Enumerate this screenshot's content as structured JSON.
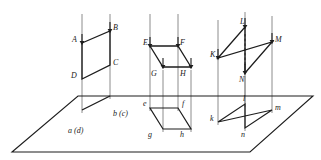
{
  "figure": {
    "type": "descriptive-geometry-diagram",
    "stroke_color": "#1d1d1d",
    "projector_color": "#8c8c8c",
    "background_color": "#ffffff",
    "ground_plane": {
      "name": "horizontal projection plane",
      "points": "12,152 78,96 313,96 250,152"
    },
    "cases": [
      {
        "id": "case-perpendicular",
        "note": "figure perpendicular to plane, projects to a straight line",
        "shape": {
          "name": "parallelogram-ABCD",
          "points": "82,43 110,31 110,65 82,79"
        },
        "projection": {
          "name": "projection-segment-ad-bc",
          "points": "82,110 110,96"
        },
        "projectors": [
          {
            "x1": 82,
            "y1": 14,
            "x2": 82,
            "y2": 113
          },
          {
            "x1": 110,
            "y1": 14,
            "x2": 110,
            "y2": 99
          }
        ],
        "arrows": [
          {
            "x": 82,
            "y": 43,
            "dir": "down"
          },
          {
            "x": 110,
            "y": 31,
            "dir": "down"
          }
        ],
        "labels": [
          {
            "id": "A",
            "text": "A",
            "x": 72,
            "y": 36
          },
          {
            "id": "B",
            "text": "B",
            "x": 113,
            "y": 24
          },
          {
            "id": "C",
            "text": "C",
            "x": 113,
            "y": 59
          },
          {
            "id": "D",
            "text": "D",
            "x": 71,
            "y": 72
          },
          {
            "id": "ad",
            "text": "a (d)",
            "x": 68,
            "y": 127
          },
          {
            "id": "bc",
            "text": "b (c)",
            "x": 113,
            "y": 110
          }
        ]
      },
      {
        "id": "case-parallel",
        "note": "figure parallel to plane, projects to a congruent figure",
        "shape": {
          "name": "parallelogram-EFGH",
          "points": "150,46 178,46 163,67 191,67"
        },
        "shape_order": "E,F,H,G",
        "projection": {
          "name": "projection-parallelogram-efgh",
          "points": "150,108 178,108 163,129 191,129"
        },
        "projectors": [
          {
            "x1": 150,
            "y1": 14,
            "x2": 150,
            "y2": 111
          },
          {
            "x1": 178,
            "y1": 14,
            "x2": 178,
            "y2": 111
          },
          {
            "x1": 163,
            "y1": 70,
            "x2": 163,
            "y2": 132
          },
          {
            "x1": 191,
            "y1": 70,
            "x2": 191,
            "y2": 132
          }
        ],
        "arrows": [
          {
            "x": 150,
            "y": 46,
            "dir": "down"
          },
          {
            "x": 178,
            "y": 46,
            "dir": "down"
          },
          {
            "x": 163,
            "y": 67,
            "dir": "down"
          },
          {
            "x": 191,
            "y": 67,
            "dir": "down"
          }
        ],
        "labels": [
          {
            "id": "E",
            "text": "E",
            "x": 143,
            "y": 39
          },
          {
            "id": "F",
            "text": "F",
            "x": 180,
            "y": 39
          },
          {
            "id": "G",
            "text": "G",
            "x": 151,
            "y": 70
          },
          {
            "id": "H",
            "text": "H",
            "x": 180,
            "y": 70
          },
          {
            "id": "e",
            "text": "e",
            "x": 143,
            "y": 100
          },
          {
            "id": "f",
            "text": "f",
            "x": 182,
            "y": 100
          },
          {
            "id": "g",
            "text": "g",
            "x": 148,
            "y": 131
          },
          {
            "id": "h",
            "text": "h",
            "x": 180,
            "y": 131
          }
        ]
      },
      {
        "id": "case-inclined",
        "note": "figure inclined to plane, projects foreshortened",
        "shape": {
          "name": "parallelogram-KLMN",
          "points": "218,58 245,27 272,42 245,73"
        },
        "shape_order": "K,L,M,N",
        "projection": {
          "name": "projection-parallelogram-klmn",
          "points": "218,122 245,104 272,110 245,128"
        },
        "projectors": [
          {
            "x1": 218,
            "y1": 20,
            "x2": 218,
            "y2": 125
          },
          {
            "x1": 245,
            "y1": 12,
            "x2": 245,
            "y2": 107
          },
          {
            "x1": 272,
            "y1": 16,
            "x2": 272,
            "y2": 113
          },
          {
            "x1": 245,
            "y1": 76,
            "x2": 245,
            "y2": 131
          }
        ],
        "hidden_edge": {
          "x1": 245,
          "y1": 34,
          "x2": 245,
          "y2": 66
        },
        "arrows": [
          {
            "x": 218,
            "y": 58,
            "dir": "down"
          },
          {
            "x": 245,
            "y": 27,
            "dir": "down"
          },
          {
            "x": 272,
            "y": 42,
            "dir": "down"
          },
          {
            "x": 245,
            "y": 73,
            "dir": "down"
          }
        ],
        "labels": [
          {
            "id": "K",
            "text": "K",
            "x": 210,
            "y": 51
          },
          {
            "id": "L",
            "text": "L",
            "x": 240,
            "y": 18
          },
          {
            "id": "M",
            "text": "M",
            "x": 275,
            "y": 36
          },
          {
            "id": "N",
            "text": "N",
            "x": 239,
            "y": 76
          },
          {
            "id": "k",
            "text": "k",
            "x": 210,
            "y": 115
          },
          {
            "id": "l",
            "text": "l",
            "x": 243,
            "y": 95
          },
          {
            "id": "m",
            "text": "m",
            "x": 275,
            "y": 104
          },
          {
            "id": "n",
            "text": "n",
            "x": 241,
            "y": 131
          }
        ]
      }
    ]
  }
}
